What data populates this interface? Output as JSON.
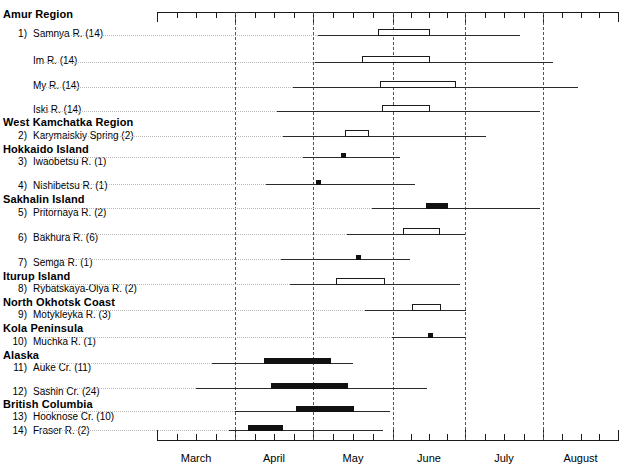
{
  "chart_data": {
    "type": "range-bar",
    "title": "",
    "xlabel": "",
    "ylabel": "",
    "grid": true,
    "legend_position": "none",
    "axis": {
      "month_ticks": [
        "March",
        "April",
        "May",
        "June",
        "July",
        "August"
      ],
      "xlim": [
        "Mar 1",
        "Aug 31"
      ],
      "minor_ticks_per_month": 4,
      "gridlines_at": [
        "Apr 1",
        "May 1",
        "Jun 1",
        "Jul 1",
        "Aug 1"
      ]
    },
    "regions": [
      {
        "region": "Amur Region",
        "rows": [
          {
            "num": "1)",
            "name": "Samnya R. (14)",
            "sample_size": 14,
            "marker": "open-box",
            "range_start": "Apr 3",
            "range_end": "Jun 23",
            "box_start": "May 5",
            "box_end": "May 25"
          },
          {
            "num": "",
            "name": "Im R. (14)",
            "sample_size": 14,
            "marker": "open-box",
            "range_start": "Apr 2",
            "range_end": "Jul 6",
            "box_start": "Apr 21",
            "box_end": "May 25"
          },
          {
            "num": "",
            "name": "My R. (14)",
            "sample_size": 14,
            "marker": "open-box",
            "range_start": "Mar 24",
            "range_end": "Jul 29",
            "box_start": "May 2",
            "box_end": "Jun 8"
          },
          {
            "num": "",
            "name": "Iski R. (14)",
            "sample_size": 14,
            "marker": "open-box",
            "range_start": "Mar 17",
            "range_end": "Jul 4",
            "box_start": "May 5",
            "box_end": "May 24"
          }
        ]
      },
      {
        "region": "West Kamchatka Region",
        "rows": [
          {
            "num": "2)",
            "name": "Karymaiskiy Spring (2)",
            "sample_size": 2,
            "marker": "open-box",
            "range_start": "Mar 20",
            "range_end": "Jun 22",
            "box_start": "Apr 25",
            "box_end": "May 7"
          }
        ]
      },
      {
        "region": "Hokkaido Island",
        "rows": [
          {
            "num": "3)",
            "name": "Iwaobetsu R. (1)",
            "sample_size": 1,
            "marker": "dot",
            "range_start": "Apr 10",
            "range_end": "May 22",
            "point": "May 4"
          },
          {
            "num": "4)",
            "name": "Nishibetsu R. (1)",
            "sample_size": 1,
            "marker": "dot",
            "range_start": "Mar 26",
            "range_end": "May 29",
            "point": "Apr 24"
          }
        ]
      },
      {
        "region": "Sakhalin Island",
        "rows": [
          {
            "num": "5)",
            "name": "Pritornaya R. (2)",
            "sample_size": 2,
            "marker": "filled-box",
            "range_start": "May 1",
            "range_end": "Jul 4",
            "box_start": "Jun 1",
            "box_end": "Jun 10"
          },
          {
            "num": "6)",
            "name": "Bakhura R. (6)",
            "sample_size": 6,
            "marker": "open-box",
            "range_start": "Apr 11",
            "range_end": "Jun 22",
            "box_start": "May 20",
            "box_end": "Jun 4"
          },
          {
            "num": "7)",
            "name": "Semga R. (1)",
            "sample_size": 1,
            "marker": "dot",
            "range_start": "Mar 4",
            "range_end": "May 24",
            "point": "Apr 22"
          }
        ]
      },
      {
        "region": "Iturup Island",
        "rows": [
          {
            "num": "8)",
            "name": "Rybatskaya-Olya R. (2)",
            "sample_size": 2,
            "marker": "open-box",
            "range_start": "Apr 5",
            "range_end": "Jun 14",
            "box_start": "Apr 27",
            "box_end": "May 21"
          }
        ]
      },
      {
        "region": "North Okhotsk Coast",
        "rows": [
          {
            "num": "9)",
            "name": "Motykleyka R. (3)",
            "sample_size": 3,
            "marker": "open-box",
            "range_start": "Apr 17",
            "range_end": "Jun 20",
            "box_start": "May 24",
            "box_end": "Jun 5"
          }
        ]
      },
      {
        "region": "Kola Peninsula",
        "rows": [
          {
            "num": "10)",
            "name": "Muchka R. (1)",
            "sample_size": 1,
            "marker": "dot",
            "range_start": "May 1",
            "range_end": "Jun 19",
            "point": "Jun 1"
          }
        ]
      },
      {
        "region": "Alaska",
        "rows": [
          {
            "num": "11)",
            "name": "Auke Cr. (11)",
            "sample_size": 11,
            "marker": "filled-box",
            "range_start": "Mar 13",
            "range_end": "May 29",
            "box_start": "Apr 14",
            "box_end": "May 13"
          },
          {
            "num": "12)",
            "name": "Sashin Cr. (24)",
            "sample_size": 24,
            "marker": "filled-box",
            "range_start": "Mar 16",
            "range_end": "Jun 19",
            "box_start": "Apr 21",
            "box_end": "May 24"
          }
        ]
      },
      {
        "region": "British Columbia",
        "rows": [
          {
            "num": "13)",
            "name": "Hooknose Cr. (10)",
            "sample_size": 10,
            "marker": "filled-box",
            "range_start": "Apr 1",
            "range_end": "Jun 2",
            "box_start": "Apr 29",
            "box_end": "May 22"
          },
          {
            "num": "14)",
            "name": "Fraser R. (2)",
            "sample_size": 2,
            "marker": "filled-box",
            "range_start": "Mar 29",
            "range_end": "Jun 11",
            "box_start": "Apr 18",
            "box_end": "May 2"
          }
        ]
      }
    ]
  },
  "geometry": {
    "plot_left": 157,
    "plot_right": 618,
    "axis_top_y": 12,
    "axis_bottom_y": 440,
    "month_tick_x": [
      157,
      235,
      313,
      393,
      465,
      543,
      618
    ],
    "rows": [
      {
        "y": 35,
        "line": [
          318,
          520
        ],
        "box": [
          378,
          430
        ],
        "type": "open"
      },
      {
        "y": 62,
        "line": [
          315,
          553
        ],
        "box": [
          362,
          430
        ],
        "type": "open"
      },
      {
        "y": 87,
        "line": [
          293,
          578
        ],
        "box": [
          380,
          456
        ],
        "type": "open"
      },
      {
        "y": 111,
        "line": [
          277,
          540
        ],
        "box": [
          382,
          430
        ],
        "type": "open"
      },
      {
        "y": 136,
        "line": [
          283,
          486
        ],
        "box": [
          345,
          369
        ],
        "type": "open"
      },
      {
        "y": 157,
        "line": [
          303,
          400
        ],
        "point": 343,
        "type": "dot"
      },
      {
        "y": 184,
        "line": [
          266,
          415
        ],
        "point": 318,
        "type": "dot"
      },
      {
        "y": 208,
        "line": [
          372,
          540
        ],
        "box": [
          426,
          448
        ],
        "type": "filled"
      },
      {
        "y": 234,
        "line": [
          347,
          465
        ],
        "box": [
          403,
          440
        ],
        "type": "open"
      },
      {
        "y": 259,
        "line": [
          281,
          410
        ],
        "point": 358,
        "type": "dot"
      },
      {
        "y": 284,
        "line": [
          290,
          460
        ],
        "box": [
          336,
          385
        ],
        "type": "open"
      },
      {
        "y": 310,
        "line": [
          365,
          466
        ],
        "box": [
          412,
          441
        ],
        "type": "open"
      },
      {
        "y": 337,
        "line": [
          392,
          466
        ],
        "point": 430,
        "type": "dot"
      },
      {
        "y": 363,
        "line": [
          212,
          353
        ],
        "box": [
          264,
          331
        ],
        "type": "filled"
      },
      {
        "y": 388,
        "line": [
          196,
          427
        ],
        "box": [
          271,
          348
        ],
        "type": "filled"
      },
      {
        "y": 411,
        "line": [
          235,
          390
        ],
        "box": [
          296,
          354
        ],
        "type": "filled"
      },
      {
        "y": 430,
        "line": [
          229,
          383
        ],
        "box": [
          248,
          283
        ],
        "type": "filled"
      }
    ]
  }
}
